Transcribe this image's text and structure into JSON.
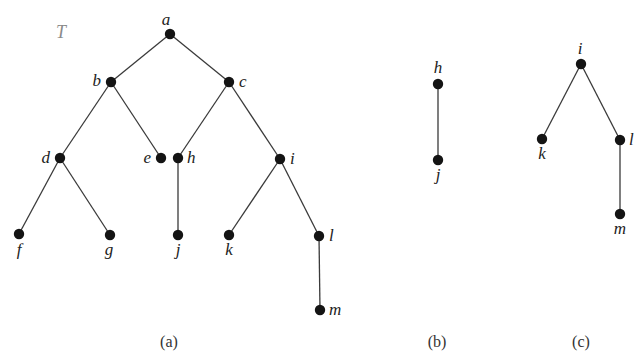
{
  "figure": {
    "tree_name": "T",
    "colors": {
      "edge": "#3a3a3a",
      "node": "#141414",
      "label": "#222222",
      "tree_name": "#8a8a8a",
      "background": "#ffffff"
    },
    "panels": [
      {
        "id": "a",
        "caption": "(a)",
        "caption_pos": [
          169,
          347
        ],
        "nodes": [
          {
            "id": "a",
            "x": 170,
            "y": 34,
            "label_dx": -4,
            "label_dy": -9,
            "anchor": "middle"
          },
          {
            "id": "b",
            "x": 111,
            "y": 82,
            "label_dx": -10,
            "label_dy": 4,
            "anchor": "end"
          },
          {
            "id": "c",
            "x": 229,
            "y": 82,
            "label_dx": 10,
            "label_dy": 5,
            "anchor": "start"
          },
          {
            "id": "d",
            "x": 60,
            "y": 158,
            "label_dx": -10,
            "label_dy": 5,
            "anchor": "end"
          },
          {
            "id": "e",
            "x": 161,
            "y": 158,
            "label_dx": -10,
            "label_dy": 5,
            "anchor": "end"
          },
          {
            "id": "h",
            "x": 178,
            "y": 158,
            "label_dx": 9,
            "label_dy": 5,
            "anchor": "start"
          },
          {
            "id": "i",
            "x": 280,
            "y": 159,
            "label_dx": 10,
            "label_dy": 5,
            "anchor": "start"
          },
          {
            "id": "f",
            "x": 19,
            "y": 234,
            "label_dx": 0,
            "label_dy": 21,
            "anchor": "middle"
          },
          {
            "id": "g",
            "x": 110,
            "y": 235,
            "label_dx": -1,
            "label_dy": 20,
            "anchor": "middle"
          },
          {
            "id": "j",
            "x": 178,
            "y": 235,
            "label_dx": 0,
            "label_dy": 20,
            "anchor": "middle"
          },
          {
            "id": "k",
            "x": 229,
            "y": 235,
            "label_dx": 0,
            "label_dy": 20,
            "anchor": "middle"
          },
          {
            "id": "l",
            "x": 319,
            "y": 236,
            "label_dx": 10,
            "label_dy": 5,
            "anchor": "start"
          },
          {
            "id": "m",
            "x": 320,
            "y": 310,
            "label_dx": 9,
            "label_dy": 5,
            "anchor": "start"
          }
        ],
        "edges": [
          [
            "a",
            "b"
          ],
          [
            "a",
            "c"
          ],
          [
            "b",
            "d"
          ],
          [
            "b",
            "e"
          ],
          [
            "c",
            "h"
          ],
          [
            "c",
            "i"
          ],
          [
            "d",
            "f"
          ],
          [
            "d",
            "g"
          ],
          [
            "h",
            "j"
          ],
          [
            "i",
            "k"
          ],
          [
            "i",
            "l"
          ],
          [
            "l",
            "m"
          ]
        ]
      },
      {
        "id": "b",
        "caption": "(b)",
        "caption_pos": [
          437,
          347
        ],
        "nodes": [
          {
            "id": "h",
            "x": 438,
            "y": 84,
            "label_dx": 0,
            "label_dy": -11,
            "anchor": "middle"
          },
          {
            "id": "j",
            "x": 438,
            "y": 160,
            "label_dx": 0,
            "label_dy": 20,
            "anchor": "middle"
          }
        ],
        "edges": [
          [
            "h",
            "j"
          ]
        ]
      },
      {
        "id": "c",
        "caption": "(c)",
        "caption_pos": [
          581,
          347
        ],
        "nodes": [
          {
            "id": "i",
            "x": 581,
            "y": 64,
            "label_dx": -1,
            "label_dy": -10,
            "anchor": "middle"
          },
          {
            "id": "k",
            "x": 542,
            "y": 139,
            "label_dx": 0,
            "label_dy": 20,
            "anchor": "middle"
          },
          {
            "id": "l",
            "x": 620,
            "y": 140,
            "label_dx": 9,
            "label_dy": 5,
            "anchor": "start"
          },
          {
            "id": "m",
            "x": 620,
            "y": 214,
            "label_dx": 0,
            "label_dy": 20,
            "anchor": "middle"
          }
        ],
        "edges": [
          [
            "i",
            "k"
          ],
          [
            "i",
            "l"
          ],
          [
            "l",
            "m"
          ]
        ]
      }
    ]
  }
}
